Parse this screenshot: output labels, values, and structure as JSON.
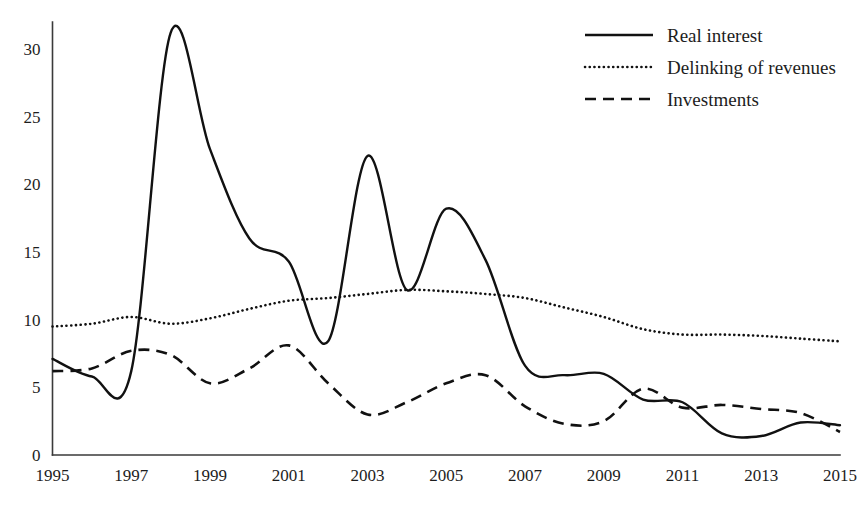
{
  "chart_data": {
    "type": "line",
    "title": "",
    "xlabel": "",
    "ylabel": "",
    "xlim": [
      1995,
      2015
    ],
    "ylim": [
      0,
      32
    ],
    "grid": false,
    "legend_position": "top-right",
    "x_tick_labels": [
      "1995",
      "1997",
      "1999",
      "2001",
      "2003",
      "2005",
      "2007",
      "2009",
      "2011",
      "2013",
      "2015"
    ],
    "x_ticks": [
      1995,
      1997,
      1999,
      2001,
      2003,
      2005,
      2007,
      2009,
      2011,
      2013,
      2015
    ],
    "y_tick_labels": [
      "0",
      "5",
      "10",
      "15",
      "20",
      "25",
      "30"
    ],
    "y_ticks": [
      0,
      5,
      10,
      15,
      20,
      25,
      30
    ],
    "x": [
      1995,
      1996,
      1997,
      1998,
      1999,
      2000,
      2001,
      2002,
      2003,
      2004,
      2005,
      2006,
      2007,
      2008,
      2009,
      2010,
      2011,
      2012,
      2013,
      2014,
      2015
    ],
    "series": [
      {
        "name": "Real interest",
        "style": "solid",
        "color": "#111111",
        "values": [
          7.1,
          5.8,
          6.2,
          31.2,
          22.6,
          16.0,
          14.3,
          8.4,
          22.1,
          12.2,
          18.2,
          14.4,
          6.6,
          5.9,
          6.0,
          4.1,
          3.9,
          1.6,
          1.4,
          2.4,
          2.2
        ]
      },
      {
        "name": "Delinking of revenues",
        "style": "dotted",
        "color": "#111111",
        "values": [
          9.5,
          9.7,
          10.2,
          9.7,
          10.1,
          10.8,
          11.4,
          11.6,
          11.9,
          12.2,
          12.1,
          11.9,
          11.6,
          10.9,
          10.2,
          9.3,
          8.9,
          8.9,
          8.8,
          8.6,
          8.4
        ]
      },
      {
        "name": "Investments",
        "style": "dashed",
        "color": "#111111",
        "values": [
          6.2,
          6.4,
          7.7,
          7.4,
          5.3,
          6.4,
          8.1,
          5.3,
          3.0,
          3.9,
          5.3,
          5.9,
          3.6,
          2.3,
          2.5,
          4.9,
          3.5,
          3.7,
          3.4,
          3.1,
          1.7
        ]
      }
    ]
  },
  "legend": {
    "items": [
      {
        "label": "Real interest"
      },
      {
        "label": "Delinking of revenues"
      },
      {
        "label": "Investments"
      }
    ]
  }
}
